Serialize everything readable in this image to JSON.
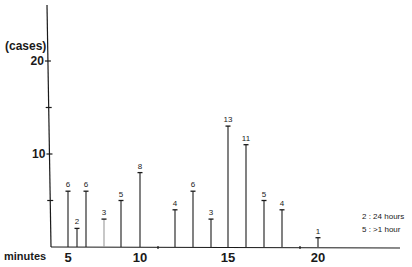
{
  "chart_data": {
    "type": "bar",
    "title": "",
    "xlabel": "minutes",
    "ylabel": "(cases)",
    "x_ticks": [
      5,
      10,
      15,
      20
    ],
    "y_ticks": [
      10,
      20
    ],
    "ylim": [
      0,
      26
    ],
    "xlim": [
      4,
      25
    ],
    "grid": false,
    "style": "vertical lines (stem plot) with value labels above each line",
    "x": [
      5,
      5.5,
      6,
      7,
      8,
      10,
      12,
      13,
      14,
      15,
      16,
      17,
      18,
      20
    ],
    "values": [
      6,
      2,
      6,
      3,
      5,
      8,
      4,
      6,
      3,
      13,
      11,
      5,
      4,
      1
    ],
    "bar_px": [
      68,
      77,
      86,
      104,
      121,
      140,
      175,
      193,
      211,
      228,
      246,
      264,
      282,
      318
    ],
    "annotations": [
      "2 : 24 hours",
      "5 : >1 hour"
    ]
  },
  "labels": {
    "ylabel": "(cases)",
    "xlabel": "minutes",
    "legend_1": "2 :  24 hours",
    "legend_2": "5 :  >1 hour"
  }
}
